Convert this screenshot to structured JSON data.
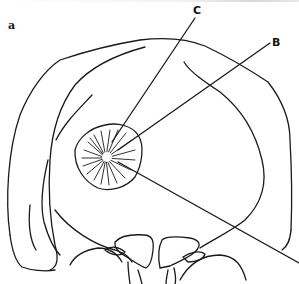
{
  "figure": {
    "panel_label": "a",
    "labels": {
      "c": "C",
      "b": "B"
    },
    "stroke_color": "#1a1a1a",
    "background": "#ffffff"
  }
}
